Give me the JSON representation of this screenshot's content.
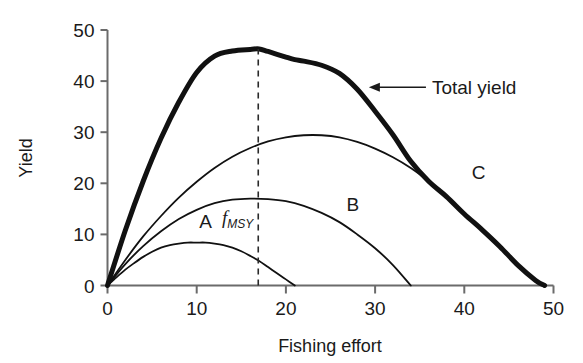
{
  "chart_data": {
    "type": "line",
    "title": "",
    "xlabel": "Fishing effort",
    "ylabel": "Yield",
    "xlim": [
      0,
      50
    ],
    "ylim": [
      0,
      50
    ],
    "xticks": [
      0,
      10,
      20,
      30,
      40,
      50
    ],
    "yticks": [
      0,
      10,
      20,
      30,
      40,
      50
    ],
    "xtick_labels": [
      "0",
      "10",
      "20",
      "30",
      "40",
      "50"
    ],
    "ytick_labels": [
      "0",
      "10",
      "20",
      "30",
      "40",
      "50"
    ],
    "grid": false,
    "legend_position": "inline-annotations",
    "series": [
      {
        "name": "A",
        "label": "A",
        "label_x": 11.0,
        "label_y": 11.2,
        "linewidth": "thin",
        "x": [
          0,
          1,
          2,
          3,
          4,
          5,
          6,
          7,
          8,
          9,
          10,
          11,
          12,
          13,
          14,
          15,
          16,
          17,
          18,
          19,
          20,
          21
        ],
        "y": [
          0,
          1.6,
          3.1,
          4.4,
          5.6,
          6.6,
          7.4,
          7.9,
          8.2,
          8.4,
          8.4,
          8.4,
          8.2,
          7.9,
          7.4,
          6.7,
          5.8,
          4.8,
          3.6,
          2.4,
          1.2,
          0
        ]
      },
      {
        "name": "B",
        "label": "B",
        "label_x": 27.5,
        "label_y": 14.6,
        "linewidth": "thin",
        "x": [
          0,
          2,
          4,
          6,
          8,
          10,
          12,
          14,
          16,
          18,
          20,
          22,
          24,
          26,
          28,
          30,
          32,
          34
        ],
        "y": [
          0,
          4.2,
          7.7,
          10.6,
          13.0,
          14.8,
          16.1,
          16.8,
          17.0,
          16.9,
          16.5,
          15.6,
          14.2,
          12.4,
          10.0,
          7.3,
          4.0,
          0
        ]
      },
      {
        "name": "C",
        "label": "C",
        "label_x": 41.6,
        "label_y": 20.9,
        "linewidth": "thin",
        "x": [
          0,
          2,
          4,
          6,
          8,
          10,
          12,
          14,
          16,
          18,
          20,
          22,
          24,
          26,
          28,
          30,
          32,
          34,
          36,
          38,
          40,
          42,
          44,
          46,
          48,
          49
        ],
        "y": [
          0,
          5.0,
          9.6,
          13.6,
          17.2,
          20.3,
          23.0,
          25.2,
          26.9,
          28.2,
          29.0,
          29.4,
          29.4,
          29.0,
          28.1,
          26.8,
          25.1,
          23.0,
          20.4,
          17.4,
          14.0,
          10.9,
          7.6,
          4.0,
          1.0,
          0
        ]
      },
      {
        "name": "Total yield",
        "label": "Total yield",
        "label_x": 33.5,
        "label_y": 40.0,
        "linewidth": "thick",
        "x": [
          0,
          2,
          4,
          6,
          8,
          10,
          12,
          14,
          16,
          17,
          18,
          20,
          21,
          22,
          24,
          26,
          28,
          30,
          32,
          34,
          36,
          38,
          40,
          42,
          44,
          46,
          48,
          49
        ],
        "y": [
          0,
          10.8,
          20.4,
          28.8,
          35.9,
          41.7,
          44.9,
          45.9,
          46.2,
          46.3,
          45.8,
          44.7,
          44.2,
          43.9,
          43.1,
          41.5,
          38.4,
          34.1,
          29.5,
          24.3,
          20.4,
          17.4,
          14.0,
          10.9,
          7.6,
          4.0,
          1.0,
          0
        ]
      }
    ],
    "annotations": [
      {
        "name": "fmsy-marker",
        "kind": "vertical-dashed-line",
        "x": 16.9,
        "y_from": 0,
        "y_to": 46.3,
        "label_main": "f",
        "label_sub": "MSY",
        "label_x": 14.6,
        "label_y": 12.0
      },
      {
        "name": "total-yield-callout",
        "kind": "arrow",
        "text": "Total yield",
        "from_x": 35.7,
        "from_y": 38.8,
        "to_x": 29.3,
        "to_y": 38.8
      }
    ],
    "colors": {
      "line": "#111111",
      "axis": "#555555",
      "text": "#1a1a1a",
      "background": "#ffffff"
    }
  }
}
